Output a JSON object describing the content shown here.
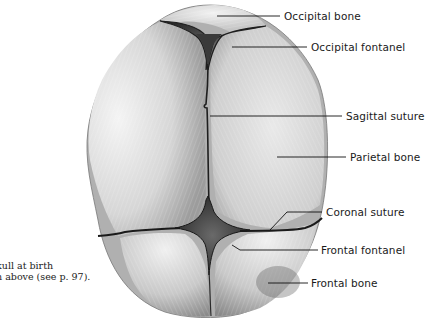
{
  "figure": {
    "labels": [
      {
        "id": "occipital-bone",
        "text": "Occipital bone",
        "x": 284,
        "y": 10,
        "line": [
          [
            217,
            16
          ],
          [
            280,
            16
          ]
        ]
      },
      {
        "id": "occipital-fontanel",
        "text": "Occipital fontanel",
        "x": 311,
        "y": 41,
        "line": [
          [
            232,
            47
          ],
          [
            307,
            47
          ]
        ]
      },
      {
        "id": "sagittal-suture",
        "text": "Sagittal suture",
        "x": 346,
        "y": 111,
        "line": [
          [
            210,
            116
          ],
          [
            342,
            116
          ]
        ]
      },
      {
        "id": "parietal-bone",
        "text": "Parietal bone",
        "x": 350,
        "y": 151,
        "line": [
          [
            277,
            157
          ],
          [
            346,
            157
          ]
        ]
      },
      {
        "id": "coronal-suture",
        "text": "Coronal suture",
        "x": 326,
        "y": 207,
        "line": [
          [
            270,
            230
          ],
          [
            287,
            212
          ],
          [
            322,
            212
          ]
        ]
      },
      {
        "id": "frontal-fontanel",
        "text": "Frontal fontanel",
        "x": 321,
        "y": 244,
        "line": [
          [
            232,
            245
          ],
          [
            240,
            250
          ],
          [
            318,
            250
          ]
        ]
      },
      {
        "id": "frontal-bone",
        "text": "Frontal bone",
        "x": 311,
        "y": 277,
        "line": [
          [
            268,
            283
          ],
          [
            308,
            283
          ]
        ]
      }
    ],
    "caption": {
      "line1": "kull at birth",
      "line2": "n above (see p. 97)."
    }
  },
  "colors": {
    "background": "#ffffff",
    "bone_light": "#e8e8e8",
    "bone_mid": "#bdbdbd",
    "bone_dark": "#8a8a8a",
    "fontanel": "#3a3a3a",
    "suture": "#1e1e1e",
    "text": "#1a1a1a"
  }
}
